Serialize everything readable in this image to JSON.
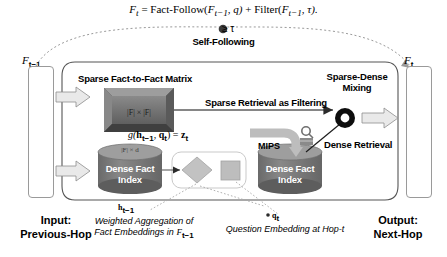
{
  "figure": {
    "formula": "Ft = Fact-Follow(Ft−1, q) + Filter(Ft−1, τ).",
    "formula_parts": {
      "lhs": "F",
      "lhs_sub": "t",
      "eq": " = ",
      "fn1": "Fact-Follow(",
      "arg1": "F",
      "arg1_sub": "t−1",
      "arg1b": ", q)",
      "plus": " + ",
      "fn2": "Filter(",
      "arg2": "F",
      "arg2_sub": "t−1",
      "arg2b": ", τ)."
    },
    "self_following_label": "Self-Following",
    "threshold_label": "≥ τ",
    "left_column_label": "F",
    "left_column_sub": "t−1",
    "right_column_label": "F",
    "right_column_sub": "t",
    "titles": {
      "sparse_matrix": "Sparse Fact-to-Fact Matrix",
      "sparse_dense_mixing": "Sparse-Dense Mixing"
    },
    "edge_labels": {
      "sparse_retrieval": "Sparse Retrieval as Filtering",
      "dense_retrieval": "Dense Retrieval",
      "mips": "MIPS"
    },
    "matrix_box_text": "|F| × |F|",
    "cylinder_dim_text": "|F| × d",
    "dense_fact_index_left": "Dense Fact Index",
    "dense_fact_index_right": "Dense Fact Index",
    "mixing_equation": "g(ht−1, qt) = zt",
    "mixing_equation_parts": {
      "g": "g(",
      "h": "h",
      "h_sub": "t−1",
      "comma": ", ",
      "q": "q",
      "q_sub": "t",
      "close": ") = ",
      "z": "z",
      "z_sub": "t"
    },
    "io_labels": {
      "input_line1": "Input:",
      "input_line2": "Previous-Hop",
      "output_line1": "Output:",
      "output_line2": "Next-Hop"
    },
    "annotations": {
      "h_symbol": "h",
      "h_symbol_sub": "t−1",
      "q_symbol": "q",
      "q_symbol_sub": "t",
      "h_caption_line1": "Weighted Aggregation of",
      "h_caption_line2": "Fact Embeddings in Ft−1",
      "h_caption_line2_pre": "Fact Embeddings in ",
      "h_caption_line2_f": "F",
      "h_caption_line2_sub": "t−1",
      "q_caption": "Question Embedding at Hop-t"
    },
    "colors": {
      "matrix_fill": "#6e6e6e",
      "cylinder_fill": "#7a7a7a",
      "diamond_fill": "#b5b5b5",
      "square_fill": "#b0b0b0",
      "arrow_fill": "#e8e8e8",
      "outline": "#333333",
      "node_ring": "#111111"
    }
  }
}
